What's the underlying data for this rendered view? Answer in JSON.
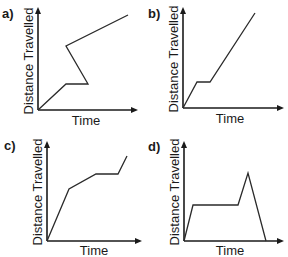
{
  "chart_data": [
    {
      "type": "line",
      "panel": "a)",
      "xlabel": "Time",
      "ylabel": "Distance Travelled",
      "grid": false,
      "description": "Distance rises, flat segment, then distance goes back in time (impossible), then rises",
      "points_px": [
        [
          38,
          110
        ],
        [
          66,
          84
        ],
        [
          88,
          84
        ],
        [
          66,
          46
        ],
        [
          128,
          15
        ]
      ],
      "axes_px": {
        "origin": [
          38,
          110
        ],
        "x_end": 137,
        "y_end": 8
      }
    },
    {
      "type": "line",
      "panel": "b)",
      "xlabel": "Time",
      "ylabel": "Distance Travelled",
      "grid": false,
      "description": "Rise, flat, then steady steeper rise",
      "points_px": [
        [
          183,
          108
        ],
        [
          197,
          82
        ],
        [
          210,
          82
        ],
        [
          255,
          13
        ]
      ],
      "axes_px": {
        "origin": [
          183,
          108
        ],
        "x_end": 283,
        "y_end": 8
      }
    },
    {
      "type": "line",
      "panel": "c)",
      "xlabel": "Time",
      "ylabel": "Distance Travelled",
      "grid": false,
      "description": "Steep rise, slower rise, flat, then rise",
      "points_px": [
        [
          47,
          241
        ],
        [
          69,
          189
        ],
        [
          96,
          174
        ],
        [
          118,
          174
        ],
        [
          127,
          156
        ]
      ],
      "axes_px": {
        "origin": [
          47,
          241
        ],
        "x_end": 141,
        "y_end": 142
      }
    },
    {
      "type": "line",
      "panel": "d)",
      "xlabel": "Time",
      "ylabel": "Distance Travelled",
      "grid": false,
      "description": "Rise, flat, rise to peak, then distance decreases to zero (impossible for distance travelled)",
      "points_px": [
        [
          184,
          241
        ],
        [
          193,
          205
        ],
        [
          238,
          205
        ],
        [
          248,
          173
        ],
        [
          266,
          241
        ]
      ],
      "axes_px": {
        "origin": [
          184,
          241
        ],
        "x_end": 283,
        "y_end": 142
      }
    }
  ],
  "panels": [
    {
      "label": "a)",
      "xlabel": "Time",
      "ylabel": "Distance Travelled"
    },
    {
      "label": "b)",
      "xlabel": "Time",
      "ylabel": "Distance Travelled"
    },
    {
      "label": "c)",
      "xlabel": "Time",
      "ylabel": "Distance Travelled"
    },
    {
      "label": "d)",
      "xlabel": "Time",
      "ylabel": "Distance Travelled"
    }
  ],
  "colors": {
    "ink": "#1a1a1a",
    "background": "#ffffff"
  }
}
